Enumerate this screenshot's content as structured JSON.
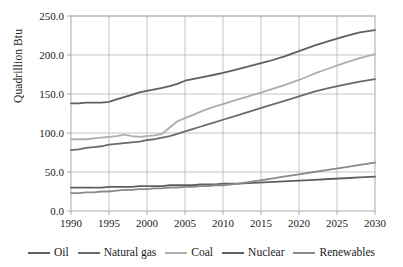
{
  "chart_data": {
    "type": "line",
    "title": "",
    "xlabel": "",
    "ylabel": "Quadrillion Btu",
    "xlim": [
      1990,
      2030
    ],
    "ylim": [
      0.0,
      250.0
    ],
    "grid": true,
    "legend_position": "bottom",
    "x": [
      1990,
      1991,
      1992,
      1993,
      1994,
      1995,
      1996,
      1997,
      1998,
      1999,
      2000,
      2001,
      2002,
      2003,
      2004,
      2005,
      2006,
      2007,
      2008,
      2009,
      2010,
      2012,
      2014,
      2016,
      2018,
      2020,
      2022,
      2024,
      2026,
      2028,
      2030
    ],
    "y_ticks": [
      0.0,
      50.0,
      100.0,
      150.0,
      200.0,
      250.0
    ],
    "y_tick_labels": [
      "0.0",
      "50.0",
      "100.0",
      "150.0",
      "200.0",
      "250.0"
    ],
    "x_ticks": [
      1990,
      1995,
      2000,
      2005,
      2010,
      2015,
      2020,
      2025,
      2030
    ],
    "x_tick_labels": [
      "1990",
      "1995",
      "2000",
      "2005",
      "2010",
      "2015",
      "2020",
      "2025",
      "2030"
    ],
    "series": [
      {
        "name": "Oil",
        "color": "#5f5f5f",
        "values": [
          138,
          138,
          139,
          139,
          139,
          140,
          143,
          146,
          149,
          152,
          154,
          156,
          158,
          160,
          163,
          167,
          169,
          171,
          173,
          175,
          177,
          182,
          187,
          192,
          198,
          205,
          212,
          218,
          224,
          229,
          232
        ]
      },
      {
        "name": "Natural gas",
        "color": "#6b6b6b",
        "values": [
          78,
          79,
          81,
          82,
          83,
          85,
          86,
          87,
          88,
          89,
          91,
          92,
          94,
          96,
          99,
          102,
          105,
          108,
          111,
          114,
          117,
          123,
          129,
          135,
          141,
          147,
          153,
          158,
          162,
          166,
          169
        ]
      },
      {
        "name": "Coal",
        "color": "#adadad",
        "values": [
          92,
          92,
          92,
          93,
          94,
          95,
          96,
          98,
          96,
          95,
          96,
          97,
          99,
          107,
          115,
          119,
          123,
          127,
          131,
          134,
          137,
          143,
          149,
          155,
          161,
          168,
          176,
          183,
          190,
          196,
          201
        ]
      },
      {
        "name": "Nuclear",
        "color": "#5f5f5f",
        "values": [
          30,
          30,
          30,
          30,
          30,
          31,
          31,
          31,
          31,
          32,
          32,
          32,
          32,
          33,
          33,
          33,
          33,
          34,
          34,
          34,
          35,
          35,
          36,
          37,
          38,
          39,
          40,
          41,
          42,
          43,
          44
        ]
      },
      {
        "name": "Renewables",
        "color": "#8a8a8a",
        "values": [
          23,
          23,
          24,
          24,
          25,
          25,
          26,
          27,
          27,
          28,
          28,
          29,
          29,
          30,
          30,
          31,
          31,
          32,
          32,
          33,
          33,
          35,
          38,
          41,
          44,
          47,
          50,
          53,
          56,
          59,
          62
        ]
      }
    ]
  },
  "legend": {
    "items": [
      {
        "label": "Oil",
        "color": "#5f5f5f"
      },
      {
        "label": "Natural gas",
        "color": "#6b6b6b"
      },
      {
        "label": "Coal",
        "color": "#adadad"
      },
      {
        "label": "Nuclear",
        "color": "#5f5f5f"
      },
      {
        "label": "Renewables",
        "color": "#8a8a8a"
      }
    ]
  },
  "axes": {
    "y_title": "Quadrillion Btu",
    "frame_color": "#a9a9a9",
    "grid_color": "#b6b6b6"
  }
}
